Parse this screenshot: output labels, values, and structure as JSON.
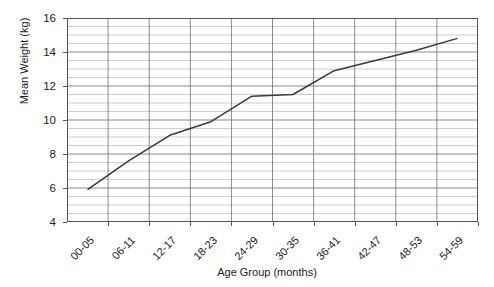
{
  "chart_data": {
    "type": "line",
    "title": "",
    "xlabel": "Age Group (months)",
    "ylabel": "Mean Weight (kg)",
    "categories": [
      "00-05",
      "06-11",
      "12-17",
      "18-23",
      "24-29",
      "30-35",
      "36-41",
      "42-47",
      "48-53",
      "54-59"
    ],
    "values": [
      5.9,
      7.6,
      9.1,
      9.9,
      11.4,
      11.5,
      12.9,
      13.5,
      14.1,
      14.8
    ],
    "ylim": [
      4,
      16
    ],
    "ytick_labels": [
      "16",
      "14",
      "12",
      "10",
      "8",
      "6",
      "4"
    ],
    "ytick_values": [
      16,
      14,
      12,
      10,
      8,
      6,
      4
    ],
    "y_major_step": 2,
    "y_minor_step": 0.5,
    "grid": "both",
    "legend": "none",
    "series_color": "#3a3a3a",
    "grid_color": "#b9b9b9",
    "major_grid_color": "#7d7d7d",
    "axis_color": "#555555"
  }
}
